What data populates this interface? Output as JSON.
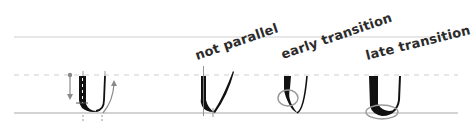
{
  "diagram": {
    "title": "",
    "guidelines": {
      "ascender_y": 37,
      "xheight_y": 75,
      "baseline_y": 113,
      "x_start": 14,
      "x_end": 458,
      "solid_color": "#c8c8c8",
      "dashed_color": "#c8c8c8"
    },
    "examples": [
      {
        "id": "correct",
        "label": "",
        "annotation": "thick downstroke, thin upstroke with direction arrows"
      },
      {
        "id": "not-parallel",
        "label": "not parallel"
      },
      {
        "id": "early-transition",
        "label": "early transition",
        "highlight": "circle at lower-left of stroke"
      },
      {
        "id": "late-transition",
        "label": "late transition",
        "highlight": "ellipse under the bowl"
      }
    ],
    "colors": {
      "ink": "#111111",
      "annotation": "#888888",
      "label": "#2b2b2b",
      "highlight": "#9a9a9a"
    }
  }
}
